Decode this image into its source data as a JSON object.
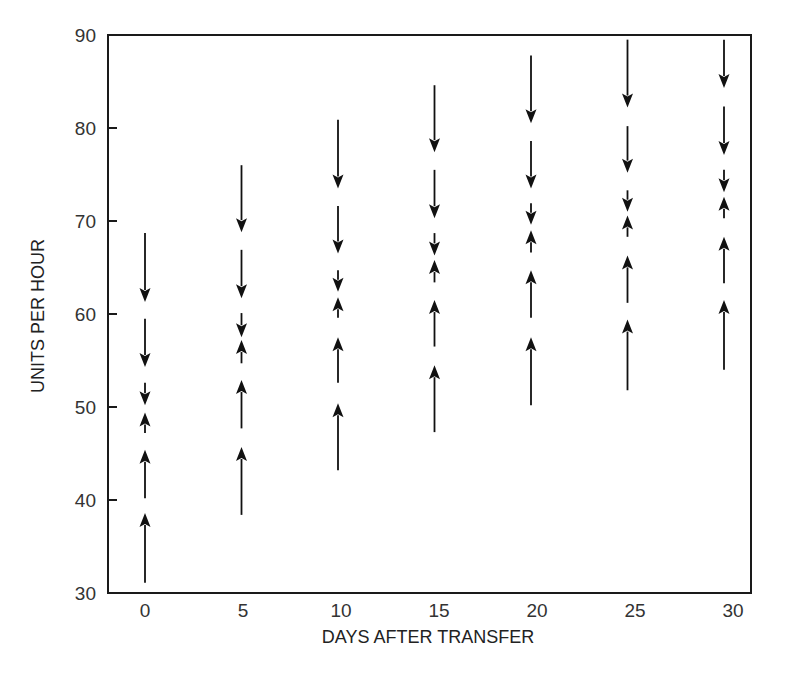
{
  "chart_data": {
    "type": "scatter",
    "subtype": "vector-arrows",
    "title": "",
    "xlabel": "DAYS AFTER TRANSFER",
    "ylabel": "UNITS PER HOUR",
    "xlim": [
      -2.0,
      31.0
    ],
    "ylim": [
      30,
      90
    ],
    "x_ticks": [
      0,
      5,
      10,
      15,
      20,
      25,
      30
    ],
    "y_ticks": [
      30,
      40,
      50,
      60,
      70,
      80,
      90
    ],
    "grid": false,
    "legend": null,
    "series": [
      {
        "x": 0,
        "arrows": [
          {
            "direction": "down",
            "from": 68.7,
            "to": 61.3
          },
          {
            "direction": "down",
            "from": 59.5,
            "to": 54.3
          },
          {
            "direction": "down",
            "from": 52.6,
            "to": 50.2
          },
          {
            "direction": "up",
            "from": 47.2,
            "to": 49.4
          },
          {
            "direction": "up",
            "from": 40.2,
            "to": 45.4
          },
          {
            "direction": "up",
            "from": 31.1,
            "to": 38.6
          }
        ]
      },
      {
        "x": 5,
        "arrows": [
          {
            "direction": "down",
            "from": 76.0,
            "to": 68.8
          },
          {
            "direction": "down",
            "from": 66.9,
            "to": 61.7
          },
          {
            "direction": "down",
            "from": 60.1,
            "to": 57.5
          },
          {
            "direction": "up",
            "from": 54.7,
            "to": 57.2
          },
          {
            "direction": "up",
            "from": 47.7,
            "to": 52.9
          },
          {
            "direction": "up",
            "from": 38.4,
            "to": 45.7
          }
        ]
      },
      {
        "x": 10,
        "arrows": [
          {
            "direction": "down",
            "from": 80.9,
            "to": 73.5
          },
          {
            "direction": "down",
            "from": 71.6,
            "to": 66.5
          },
          {
            "direction": "down",
            "from": 64.7,
            "to": 62.4
          },
          {
            "direction": "up",
            "from": 59.6,
            "to": 61.8
          },
          {
            "direction": "up",
            "from": 52.6,
            "to": 57.5
          },
          {
            "direction": "up",
            "from": 43.2,
            "to": 50.4
          }
        ]
      },
      {
        "x": 15,
        "arrows": [
          {
            "direction": "down",
            "from": 84.6,
            "to": 77.4
          },
          {
            "direction": "down",
            "from": 75.5,
            "to": 70.3
          },
          {
            "direction": "down",
            "from": 68.7,
            "to": 66.3
          },
          {
            "direction": "up",
            "from": 63.4,
            "to": 65.8
          },
          {
            "direction": "up",
            "from": 56.5,
            "to": 61.5
          },
          {
            "direction": "up",
            "from": 47.3,
            "to": 54.5
          }
        ]
      },
      {
        "x": 20,
        "arrows": [
          {
            "direction": "down",
            "from": 87.8,
            "to": 80.5
          },
          {
            "direction": "down",
            "from": 78.6,
            "to": 73.5
          },
          {
            "direction": "down",
            "from": 71.9,
            "to": 69.6
          },
          {
            "direction": "up",
            "from": 66.6,
            "to": 69.0
          },
          {
            "direction": "up",
            "from": 59.6,
            "to": 64.7
          },
          {
            "direction": "up",
            "from": 50.2,
            "to": 57.5
          }
        ]
      },
      {
        "x": 25,
        "arrows": [
          {
            "direction": "down",
            "from": 89.5,
            "to": 82.2
          },
          {
            "direction": "down",
            "from": 80.2,
            "to": 75.2
          },
          {
            "direction": "down",
            "from": 73.3,
            "to": 71.0
          },
          {
            "direction": "up",
            "from": 68.3,
            "to": 70.6
          },
          {
            "direction": "up",
            "from": 61.2,
            "to": 66.3
          },
          {
            "direction": "up",
            "from": 51.8,
            "to": 59.4
          }
        ]
      },
      {
        "x": 30,
        "arrows": [
          {
            "direction": "down",
            "from": 89.5,
            "to": 84.3
          },
          {
            "direction": "down",
            "from": 82.3,
            "to": 77.1
          },
          {
            "direction": "down",
            "from": 75.5,
            "to": 73.1
          },
          {
            "direction": "up",
            "from": 70.3,
            "to": 72.6
          },
          {
            "direction": "up",
            "from": 63.3,
            "to": 68.3
          },
          {
            "direction": "up",
            "from": 54.0,
            "to": 61.5
          }
        ]
      }
    ]
  },
  "colors": {
    "axis": "#1a1a1a",
    "arrow": "#111111",
    "text": "#333333",
    "background": "#ffffff"
  }
}
